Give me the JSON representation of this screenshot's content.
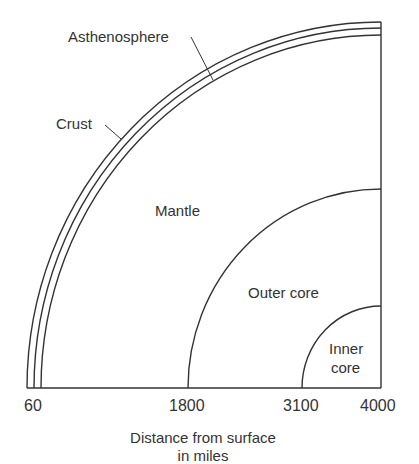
{
  "diagram": {
    "layers": {
      "asthenosphere": "Asthenosphere",
      "crust": "Crust",
      "mantle": "Mantle",
      "outer_core": "Outer core",
      "inner_core_line1": "Inner",
      "inner_core_line2": "core"
    },
    "axis": {
      "ticks": [
        "60",
        "1800",
        "3100",
        "4000"
      ],
      "title_line1": "Distance from surface",
      "title_line2": "in miles"
    },
    "colors": {
      "line": "#333333",
      "background": "#ffffff"
    }
  }
}
